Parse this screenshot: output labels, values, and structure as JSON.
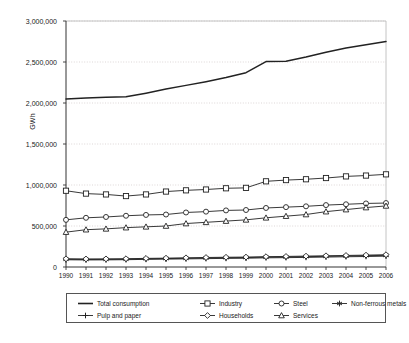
{
  "chart_data": {
    "type": "line",
    "title": "",
    "xlabel": "",
    "ylabel": "GWh",
    "grid": true,
    "legend_position": "bottom",
    "x": [
      1990,
      1991,
      1992,
      1993,
      1994,
      1995,
      1996,
      1997,
      1998,
      1999,
      2000,
      2001,
      2002,
      2003,
      2004,
      2005,
      2006
    ],
    "xtick_labels": [
      "1990",
      "1991",
      "1992",
      "1993",
      "1994",
      "1995",
      "1996",
      "1997",
      "1998",
      "1999",
      "2000",
      "2001",
      "2002",
      "2003",
      "2004",
      "2005",
      "2006"
    ],
    "ylim": [
      0,
      3000000
    ],
    "ytick_values": [
      0,
      500000,
      1000000,
      1500000,
      2000000,
      2500000,
      3000000
    ],
    "ytick_labels": [
      "0",
      "500,000",
      "1,000,000",
      "1,500,000",
      "2,000,000",
      "2,500,000",
      "3,000,000"
    ],
    "series": [
      {
        "name": "Total consumption",
        "marker": "none",
        "color": "#222222",
        "values": [
          2050000,
          2060000,
          2070000,
          2075000,
          2120000,
          2170000,
          2215000,
          2260000,
          2310000,
          2370000,
          2505000,
          2510000,
          2560000,
          2620000,
          2670000,
          2710000,
          2750000
        ]
      },
      {
        "name": "Industry",
        "marker": "square",
        "color": "#222222",
        "values": [
          930000,
          895000,
          885000,
          865000,
          885000,
          920000,
          935000,
          945000,
          960000,
          965000,
          1045000,
          1060000,
          1070000,
          1085000,
          1105000,
          1115000,
          1130000
        ]
      },
      {
        "name": "Steel",
        "marker": "circle",
        "color": "#222222",
        "values": [
          575000,
          600000,
          610000,
          625000,
          635000,
          640000,
          665000,
          675000,
          690000,
          695000,
          720000,
          730000,
          740000,
          755000,
          765000,
          775000,
          780000
        ]
      },
      {
        "name": "Non-ferrous metals",
        "marker": "asterisk",
        "color": "#222222",
        "values": [
          95000,
          92000,
          93000,
          95000,
          100000,
          103000,
          106000,
          110000,
          113000,
          115000,
          120000,
          122000,
          126000,
          130000,
          134000,
          138000,
          142000
        ]
      },
      {
        "name": "Pulp and paper",
        "marker": "plus",
        "color": "#222222",
        "values": [
          88000,
          86000,
          87000,
          89000,
          93000,
          96000,
          99000,
          102000,
          105000,
          107000,
          112000,
          114000,
          117000,
          121000,
          125000,
          128000,
          132000
        ]
      },
      {
        "name": "Households",
        "marker": "diamond",
        "color": "#222222",
        "values": [
          100000,
          98000,
          99000,
          101000,
          105000,
          108000,
          112000,
          116000,
          119000,
          121000,
          126000,
          129000,
          133000,
          137000,
          141000,
          145000,
          150000
        ]
      },
      {
        "name": "Services",
        "marker": "triangle",
        "color": "#222222",
        "values": [
          425000,
          455000,
          465000,
          480000,
          490000,
          500000,
          530000,
          545000,
          560000,
          575000,
          600000,
          620000,
          640000,
          675000,
          700000,
          725000,
          745000
        ]
      }
    ]
  },
  "legend": {
    "rows": [
      [
        "Total consumption",
        "Industry",
        "Steel",
        "Non-ferrous metals"
      ],
      [
        "Pulp and paper",
        "Households",
        "Services"
      ]
    ]
  }
}
